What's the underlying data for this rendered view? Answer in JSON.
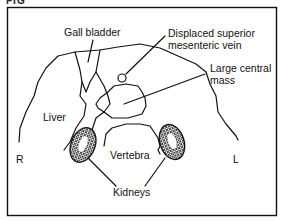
{
  "figure": {
    "header_fragment": "FIG",
    "labels": {
      "gall_bladder": "Gall bladder",
      "smv_line1": "Displaced superior",
      "smv_line2": "mesenteric vein",
      "mass_line1": "Large central",
      "mass_line2": "mass",
      "liver": "Liver",
      "vertebra": "Vertebra",
      "kidneys": "Kidneys",
      "right": "R",
      "left": "L"
    },
    "colors": {
      "ink": "#111111",
      "background": "#ffffff"
    }
  }
}
